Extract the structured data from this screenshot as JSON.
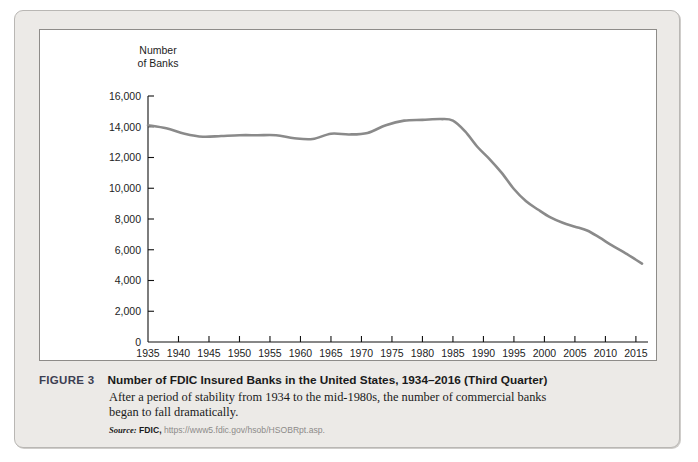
{
  "figure": {
    "number_label": "FIGURE 3",
    "title": "Number of FDIC Insured Banks in the United States, 1934–2016 (Third Quarter)",
    "description": "After a period of stability from 1934 to the mid-1980s, the number of commercial banks began to fall dramatically.",
    "source_word": "Source:",
    "source_org": "FDIC,",
    "source_url": "https://www5.fdic.gov/hsob/HSOBRpt.asp."
  },
  "colors": {
    "card_background": "#eceae7",
    "card_border": "#b9b7b4",
    "panel_background": "#ffffff",
    "panel_border": "#8e8c89",
    "line": "#8a8a8a",
    "axis": "#111111",
    "figure_number": "#3c3f52"
  },
  "chart_data": {
    "type": "line",
    "xlabel": "",
    "ylabel": "Number of Banks",
    "ylabel_lines": [
      "Number",
      "of Banks"
    ],
    "xlim": [
      1935,
      2016
    ],
    "ylim": [
      0,
      16000
    ],
    "grid": false,
    "legend": null,
    "yticks": [
      0,
      2000,
      4000,
      6000,
      8000,
      10000,
      12000,
      14000,
      16000
    ],
    "ytick_labels": [
      "0",
      "2,000",
      "4,000",
      "6,000",
      "8,000",
      "10,000",
      "12,000",
      "14,000",
      "16,000"
    ],
    "xticks": [
      1935,
      1940,
      1945,
      1950,
      1955,
      1960,
      1965,
      1970,
      1975,
      1980,
      1985,
      1990,
      1995,
      2000,
      2005,
      2010,
      2015
    ],
    "xtick_labels": [
      "1935",
      "1940",
      "1945",
      "1950",
      "1955",
      "1960",
      "1965",
      "1970",
      "1975",
      "1980",
      "1985",
      "1990",
      "1995",
      "2000",
      "2005",
      "2010",
      "2015"
    ],
    "series": [
      {
        "name": "Number of FDIC Insured Banks",
        "color": "#8a8a8a",
        "x": [
          1935,
          1938,
          1941,
          1944,
          1947,
          1950,
          1953,
          1956,
          1959,
          1962,
          1965,
          1968,
          1971,
          1974,
          1977,
          1980,
          1983,
          1985,
          1987,
          1989,
          1991,
          1993,
          1995,
          1997,
          1999,
          2001,
          2003,
          2005,
          2007,
          2009,
          2011,
          2013,
          2015,
          2016
        ],
        "values": [
          14100,
          13900,
          13550,
          13350,
          13400,
          13450,
          13450,
          13450,
          13250,
          13200,
          13550,
          13500,
          13600,
          14100,
          14400,
          14450,
          14500,
          14400,
          13700,
          12700,
          11900,
          11000,
          9950,
          9150,
          8600,
          8100,
          7750,
          7500,
          7250,
          6800,
          6300,
          5850,
          5350,
          5100
        ]
      }
    ]
  }
}
